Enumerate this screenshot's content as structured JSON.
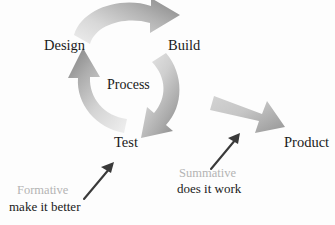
{
  "diagram": {
    "background_color": "#fdfdfd",
    "center_label": "Process",
    "nodes": [
      {
        "id": "design",
        "label": "Design"
      },
      {
        "id": "build",
        "label": "Build"
      },
      {
        "id": "test",
        "label": "Test"
      },
      {
        "id": "product",
        "label": "Product"
      }
    ],
    "cycle_arrows": [
      {
        "id": "design-to-build",
        "from": "Design",
        "to": "Build",
        "style": "curved",
        "color_light": "#e8e8e8",
        "color_dark": "#909090"
      },
      {
        "id": "build-to-test",
        "from": "Build",
        "to": "Test",
        "style": "curved",
        "color_light": "#e4e4e4",
        "color_dark": "#8e8e8e"
      },
      {
        "id": "test-to-design",
        "from": "Test",
        "to": "Design",
        "style": "curved",
        "color_light": "#e6e6e6",
        "color_dark": "#8c8c8c"
      }
    ],
    "output_arrow": {
      "id": "cycle-to-product",
      "from": "Process",
      "to": "Product",
      "style": "straight",
      "color_light": "#e2e2e2",
      "color_dark": "#9b9b9b"
    },
    "annotations": [
      {
        "id": "formative",
        "title": "Formative",
        "subtitle": "make it better",
        "title_color": "#b4b4b4",
        "subtitle_color": "#1a1a1a",
        "pointer_target": "Test"
      },
      {
        "id": "summative",
        "title": "Summative",
        "subtitle": "does it work",
        "title_color": "#b4b4b4",
        "subtitle_color": "#1a1a1a",
        "pointer_target": "Product"
      }
    ],
    "pointer_arrow_color": "#3a3a3a"
  }
}
